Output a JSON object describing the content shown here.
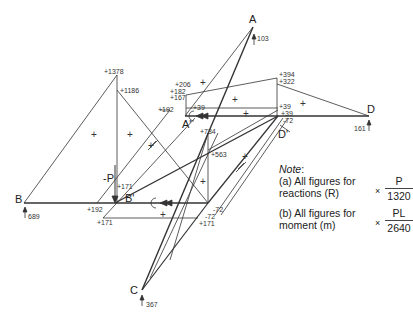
{
  "nodes": {
    "A": "A",
    "A_prime": "A'",
    "B": "B",
    "B_prime": "B'",
    "C": "C",
    "D": "D",
    "D_prime": "D'",
    "load": "-P"
  },
  "reactions": {
    "A": "103",
    "B": "689",
    "C": "367",
    "D": "161"
  },
  "moment_values": {
    "peak_B_side": "+1378",
    "B_side_second": "+1186",
    "A_prime_top1": "+206",
    "A_prime_top2": "+182",
    "A_prime_top3": "+167",
    "A_prime_left": "+192",
    "A_prime_right": "+39",
    "D_prime_top1": "+394",
    "D_prime_top2": "+322",
    "D_prime_a": "+39",
    "D_prime_b": "+39",
    "D_prime_c": "-72",
    "C_prime_peak": "+734",
    "C_prime_second": "+563",
    "B_prime_upper": "+171",
    "B_bottom_left": "+192",
    "B_bottom_right": "+171",
    "C_prime_a": "-72",
    "C_prime_b": "-72",
    "C_prime_c": "+171"
  },
  "sign_marker": "+",
  "note": {
    "title": "Note",
    "title_suffix": ":",
    "a_text_line1": "(a) All figures for",
    "a_text_line2": "reactions (R)",
    "a_times": "×",
    "a_numerator": "P",
    "a_denominator": "1320",
    "b_text_line1": "(b) All figures for",
    "b_text_line2": "moment (m)",
    "b_times": "×",
    "b_numerator": "PL",
    "b_denominator": "2640"
  },
  "colors": {
    "line": "#333333",
    "text": "#222222",
    "background": "#ffffff"
  }
}
